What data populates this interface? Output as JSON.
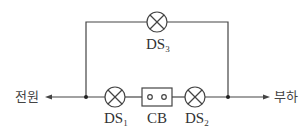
{
  "diagram": {
    "type": "circuit",
    "colors": {
      "wire": "#444444",
      "text": "#333333",
      "background": "#ffffff"
    },
    "terminals": {
      "source_label": "전원",
      "load_label": "부하"
    },
    "components": {
      "ds1": {
        "prefix": "DS",
        "sub": "1",
        "symbol": "lamp-crossed-circle"
      },
      "ds2": {
        "prefix": "DS",
        "sub": "2",
        "symbol": "lamp-crossed-circle"
      },
      "ds3": {
        "prefix": "DS",
        "sub": "3",
        "symbol": "lamp-crossed-circle"
      },
      "cb": {
        "label": "CB",
        "symbol": "circuit-breaker-box"
      }
    },
    "junctions": [
      "left-node",
      "right-node"
    ],
    "topology": "전원 → [DS1 – CB – DS2] in parallel with [DS3] → 부하"
  }
}
